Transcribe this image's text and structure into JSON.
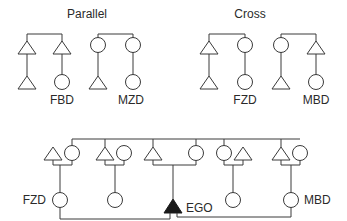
{
  "diagram": {
    "type": "kinship-chart",
    "colors": {
      "line": "#3a3a3a",
      "ego": "#1a1a1a",
      "background": "#ffffff"
    },
    "panels": [
      {
        "id": "parallel",
        "title": "Parallel",
        "groups": [
          {
            "parents": [
              "male",
              "male"
            ],
            "children": [
              [
                "male",
                ""
              ],
              [
                "female",
                "FBD"
              ]
            ]
          },
          {
            "parents": [
              "female",
              "female"
            ],
            "children": [
              [
                "male",
                ""
              ],
              [
                "female",
                "MZD"
              ]
            ]
          }
        ]
      },
      {
        "id": "cross",
        "title": "Cross",
        "groups": [
          {
            "parents": [
              "male",
              "female"
            ],
            "children": [
              [
                "male",
                ""
              ],
              [
                "female",
                "FZD"
              ]
            ]
          },
          {
            "parents": [
              "female",
              "male"
            ],
            "children": [
              [
                "male",
                ""
              ],
              [
                "female",
                "MBD"
              ]
            ]
          }
        ]
      }
    ],
    "bottom": {
      "labels": {
        "fzd": "FZD",
        "ego": "EGO",
        "mbd": "MBD"
      },
      "description": "Sibling set of parents generation; EGO linked to FZD and MBD"
    }
  }
}
